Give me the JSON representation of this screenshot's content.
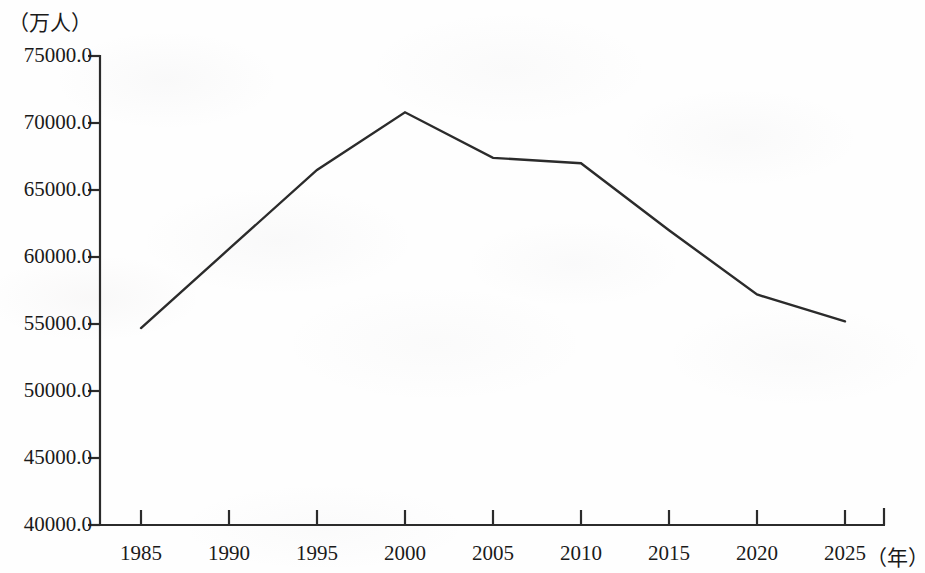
{
  "chart_data": {
    "type": "line",
    "title": "",
    "subtitle": "",
    "xlabel": "（年）",
    "ylabel": "（万人）",
    "x": [
      1985,
      1990,
      1995,
      2000,
      2005,
      2010,
      2015,
      2020,
      2025
    ],
    "categories": [
      "1985",
      "1990",
      "1995",
      "2000",
      "2005",
      "2010",
      "2015",
      "2020",
      "2025"
    ],
    "values": [
      54700,
      60600,
      66500,
      70800,
      67400,
      67000,
      62000,
      57200,
      55200
    ],
    "series": [
      {
        "name": "",
        "values": [
          54700,
          60600,
          66500,
          70800,
          67400,
          67000,
          62000,
          57200,
          55200
        ]
      }
    ],
    "xlim": [
      1985,
      2025
    ],
    "ylim": [
      40000,
      75000
    ],
    "ytick_labels": [
      "75000.0",
      "70000.0",
      "65000.0",
      "60000.0",
      "55000.0",
      "50000.0",
      "45000.0",
      "40000.0"
    ],
    "ytick_values": [
      75000,
      70000,
      65000,
      60000,
      55000,
      50000,
      45000,
      40000
    ],
    "xtick_labels": [
      "1985",
      "1990",
      "1995",
      "2000",
      "2005",
      "2010",
      "2015",
      "2020",
      "2025"
    ],
    "grid": false,
    "legend": false,
    "legend_position": "none",
    "line_color": "#2b2b2b",
    "axis_color": "#2b2b2b",
    "background_color": "#ffffff"
  },
  "axes": {
    "y_unit": "（万人）",
    "x_unit": "（年）"
  }
}
